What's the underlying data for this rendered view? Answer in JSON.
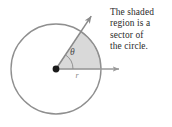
{
  "figure": {
    "background_color": "#ffffff"
  },
  "caption": {
    "lines": [
      "The shaded",
      "region is a",
      "sector of",
      "the circle."
    ],
    "full_text": "The shaded region is a sector of the circle.",
    "color": "#2b2b2b"
  },
  "diagram": {
    "center": {
      "x": 56,
      "y": 69
    },
    "radius": 45,
    "circle_stroke_color": "#8f8f8f",
    "circle_fill_color": "#ffffff",
    "sector": {
      "fill_color": "#d9d9d9",
      "start_angle_deg": 0,
      "end_angle_deg": 56,
      "stroke_color": "#8f8f8f"
    },
    "rays": {
      "horizontal": {
        "from": {
          "x": 56,
          "y": 69
        },
        "to": {
          "x": 125,
          "y": 69
        },
        "color": "#9a9a9a",
        "arrowhead": true
      },
      "angled": {
        "from": {
          "x": 56,
          "y": 69
        },
        "to": {
          "x": 96,
          "y": 9
        },
        "color": "#8a8a8a",
        "arrowhead": true
      }
    },
    "angle_arc": {
      "radius": 17,
      "color": "#8a8a8a"
    },
    "center_dot": {
      "radius": 3.4,
      "color": "#1a1a1a"
    },
    "labels": {
      "theta": "θ",
      "radius": "r"
    }
  }
}
